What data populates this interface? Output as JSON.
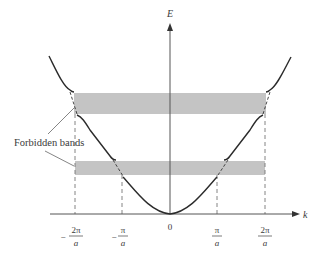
{
  "diagram": {
    "axes": {
      "y_label": "E",
      "x_label": "k"
    },
    "tick_labels": [
      {
        "sign": "−",
        "numerator": "2π",
        "denominator": "a",
        "x": 75
      },
      {
        "sign": "−",
        "numerator": "π",
        "denominator": "a",
        "x": 122
      },
      {
        "sign": "",
        "numerator": "0",
        "denominator": "",
        "x": 170
      },
      {
        "sign": "",
        "numerator": "π",
        "denominator": "a",
        "x": 217
      },
      {
        "sign": "",
        "numerator": "2π",
        "denominator": "a",
        "x": 265
      }
    ],
    "annotation": "Forbidden bands",
    "bands": [
      {
        "name": "upper-forbidden-band",
        "y_top": 93,
        "y_bottom": 114
      },
      {
        "name": "lower-forbidden-band",
        "y_top": 161,
        "y_bottom": 175
      }
    ],
    "colors": {
      "band": "#c4c4c4",
      "curve": "#2b2b2b",
      "axis": "#555555",
      "dash": "#777777"
    }
  }
}
